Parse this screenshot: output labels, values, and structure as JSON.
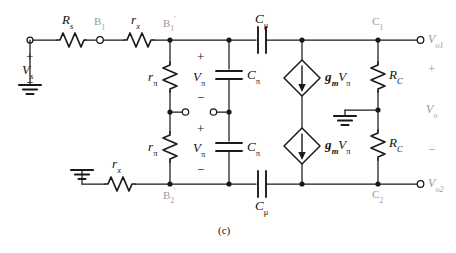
{
  "figure": {
    "caption": "(c)",
    "ink_color": "#1a1a1a",
    "faded_color": "#9a9a9a"
  },
  "nodes": [
    {
      "id": "B1",
      "label": "B",
      "sub": "1",
      "prime": "",
      "faded": true
    },
    {
      "id": "B1p",
      "label": "B",
      "sub": "1",
      "prime": "'",
      "faded": true
    },
    {
      "id": "B2p",
      "label": "B",
      "sub": "2",
      "prime": "'",
      "faded": true
    },
    {
      "id": "C1",
      "label": "C",
      "sub": "1",
      "prime": "",
      "faded": true
    },
    {
      "id": "C2",
      "label": "C",
      "sub": "2",
      "prime": "",
      "faded": true
    }
  ],
  "components": {
    "Rs": {
      "label": "R",
      "sub": "s"
    },
    "rx1": {
      "label": "r",
      "sub": "x"
    },
    "rx2": {
      "label": "r",
      "sub": "x"
    },
    "rpi1": {
      "label": "r",
      "sub": "π"
    },
    "rpi2": {
      "label": "r",
      "sub": "π"
    },
    "Cpi1": {
      "label": "C",
      "sub": "π"
    },
    "Cpi2": {
      "label": "C",
      "sub": "π"
    },
    "Cmu1": {
      "label": "C",
      "sub": "μ"
    },
    "Cmu2": {
      "label": "C",
      "sub": "μ"
    },
    "RC1": {
      "label": "R",
      "sub": "C"
    },
    "RC2": {
      "label": "R",
      "sub": "C"
    },
    "src1": {
      "label": "g",
      "sub": "m",
      "label2": "V",
      "sub2": "π"
    },
    "src2": {
      "label": "g",
      "sub": "m",
      "label2": "V",
      "sub2": "π"
    }
  },
  "voltages": {
    "Vs": {
      "label": "V",
      "sub": "s",
      "plus": "+",
      "minus": "−"
    },
    "Vpi1": {
      "label": "V",
      "sub": "π",
      "plus": "+",
      "minus": "−"
    },
    "Vpi2": {
      "label": "V",
      "sub": "π",
      "plus": "+",
      "minus": "−"
    },
    "Vo1": {
      "label": "V",
      "sub": "o1",
      "faded": true
    },
    "Vo2": {
      "label": "V",
      "sub": "o2",
      "faded": true
    },
    "Vo": {
      "label": "V",
      "sub": "o",
      "plus": "+",
      "minus": "−",
      "faded": true
    }
  }
}
